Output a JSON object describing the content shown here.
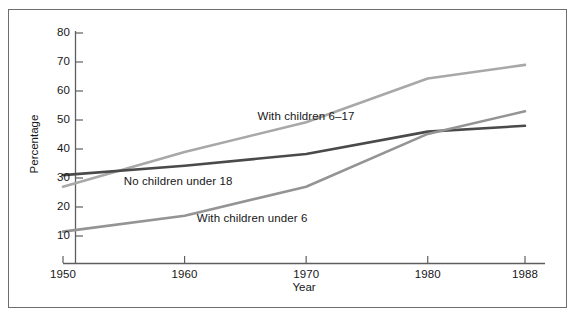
{
  "figure": {
    "border_color": "#6d6d6d",
    "background": "#ffffff"
  },
  "chart_data": {
    "type": "line",
    "title": "",
    "xlabel": "Year",
    "ylabel": "Percentage",
    "x": [
      1950,
      1960,
      1970,
      1980,
      1988
    ],
    "xlim": [
      1950,
      1988
    ],
    "ylim": [
      5,
      80
    ],
    "yticks": [
      10,
      20,
      30,
      40,
      50,
      60,
      70,
      80
    ],
    "xticks": [
      1950,
      1960,
      1970,
      1980,
      1988
    ],
    "xtick_labels": [
      "1950",
      "1960",
      "1970",
      "1980",
      "1988"
    ],
    "ytick_labels": [
      "10",
      "20",
      "30",
      "40",
      "50",
      "60",
      "70",
      "80"
    ],
    "grid": false,
    "legend": "inline-annotations",
    "series": [
      {
        "name": "With children 6-17",
        "label": "With children 6–17",
        "color": "#a8a8a8",
        "values": [
          27.0,
          39.0,
          49.2,
          64.3,
          69.0
        ]
      },
      {
        "name": "No children under 18",
        "label": "No children under 18",
        "color": "#4a4a4a",
        "values": [
          31.0,
          34.2,
          38.3,
          46.0,
          48.0
        ]
      },
      {
        "name": "With children under 6",
        "label": "With children under 6",
        "color": "#949494",
        "values": [
          11.5,
          17.0,
          27.0,
          45.2,
          53.0
        ]
      }
    ],
    "annotations": [
      {
        "text": "With children 6–17",
        "x": 1966,
        "y": 51
      },
      {
        "text": "No children under 18",
        "x": 1955,
        "y": 28.5
      },
      {
        "text": "With children under 6",
        "x": 1961,
        "y": 16
      }
    ]
  },
  "axes": {
    "y_title": "Percentage",
    "x_title": "Year"
  }
}
